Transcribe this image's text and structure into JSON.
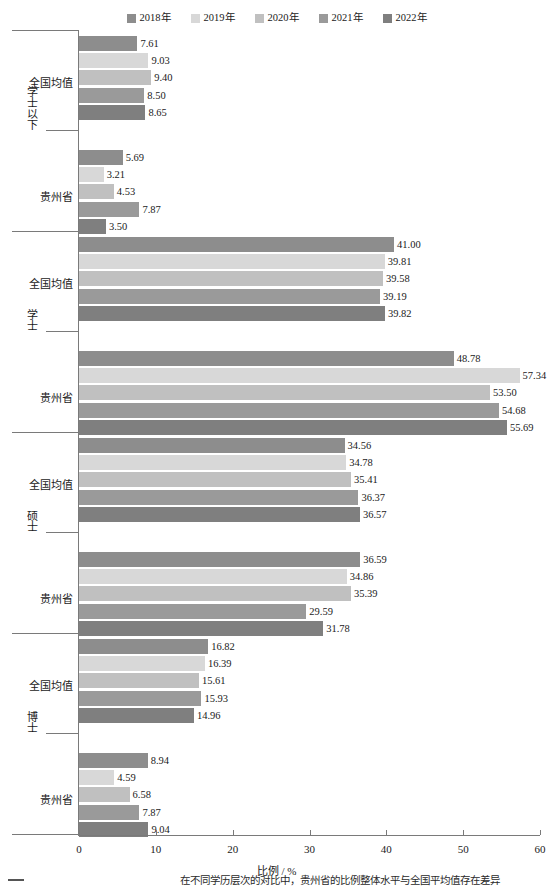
{
  "legend": {
    "position": "top-center",
    "entries": [
      {
        "label": "2018年",
        "color": "#8d8d8d"
      },
      {
        "label": "2019年",
        "color": "#d8d8d8"
      },
      {
        "label": "2020年",
        "color": "#c0c0c0"
      },
      {
        "label": "2021年",
        "color": "#9a9a9a"
      },
      {
        "label": "2022年",
        "color": "#7f7f7f"
      }
    ]
  },
  "axis": {
    "x_title": "比例 / %",
    "x_ticks": [
      "0",
      "10",
      "20",
      "30",
      "40",
      "50",
      "60"
    ],
    "x_min": 0,
    "x_max": 60
  },
  "groups": [
    {
      "name": "学士以下",
      "subgroups": [
        {
          "name": "全国均值",
          "values": [
            "7.61",
            "9.03",
            "9.40",
            "8.50",
            "8.65"
          ]
        },
        {
          "name": "贵州省",
          "values": [
            "5.69",
            "3.21",
            "4.53",
            "7.87",
            "3.50"
          ]
        }
      ]
    },
    {
      "name": "学士",
      "subgroups": [
        {
          "name": "全国均值",
          "values": [
            "41.00",
            "39.81",
            "39.58",
            "39.19",
            "39.82"
          ]
        },
        {
          "name": "贵州省",
          "values": [
            "48.78",
            "57.34",
            "53.50",
            "54.68",
            "55.69"
          ]
        }
      ]
    },
    {
      "name": "硕士",
      "subgroups": [
        {
          "name": "全国均值",
          "values": [
            "34.56",
            "34.78",
            "35.41",
            "36.37",
            "36.57"
          ]
        },
        {
          "name": "贵州省",
          "values": [
            "36.59",
            "34.86",
            "35.39",
            "29.59",
            "31.78"
          ]
        }
      ]
    },
    {
      "name": "博士",
      "subgroups": [
        {
          "name": "全国均值",
          "values": [
            "16.82",
            "16.39",
            "15.61",
            "15.93",
            "14.96"
          ]
        },
        {
          "name": "贵州省",
          "values": [
            "8.94",
            "4.59",
            "6.58",
            "7.87",
            "9.04"
          ]
        }
      ]
    }
  ],
  "chart_data": {
    "type": "bar",
    "orientation": "horizontal",
    "title": "",
    "xlabel": "比例 / %",
    "ylabel": "",
    "xlim": [
      0,
      60
    ],
    "grid": false,
    "legend_position": "top-center",
    "categories": [
      "学士以下 - 全国均值",
      "学士以下 - 贵州省",
      "学士 - 全国均值",
      "学士 - 贵州省",
      "硕士 - 全国均值",
      "硕士 - 贵州省",
      "博士 - 全国均值",
      "博士 - 贵州省"
    ],
    "series": [
      {
        "name": "2018年",
        "color": "#8d8d8d",
        "values": [
          7.61,
          5.69,
          41.0,
          48.78,
          34.56,
          36.59,
          16.82,
          8.94
        ]
      },
      {
        "name": "2019年",
        "color": "#d8d8d8",
        "values": [
          9.03,
          3.21,
          39.81,
          57.34,
          34.78,
          34.86,
          16.39,
          4.59
        ]
      },
      {
        "name": "2020年",
        "color": "#c0c0c0",
        "values": [
          9.4,
          4.53,
          39.58,
          53.5,
          35.41,
          35.39,
          15.61,
          6.58
        ]
      },
      {
        "name": "2021年",
        "color": "#9a9a9a",
        "values": [
          8.5,
          7.87,
          39.19,
          54.68,
          36.37,
          29.59,
          15.93,
          7.87
        ]
      },
      {
        "name": "2022年",
        "color": "#7f7f7f",
        "values": [
          8.65,
          3.5,
          39.82,
          55.69,
          36.57,
          31.78,
          14.96,
          9.04
        ]
      }
    ]
  },
  "caption": {
    "text": "在不同学历层次的对比中，贵州省的比例整体水平与全国平均值存在差异"
  }
}
